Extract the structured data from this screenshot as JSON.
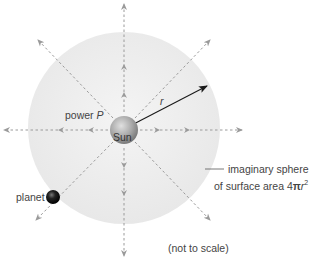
{
  "diagram": {
    "sun_label": "Sun",
    "power_label_prefix": "power ",
    "power_symbol": "P",
    "radius_label": "r",
    "planet_label": "planet",
    "sphere_label_line1": "imaginary sphere",
    "sphere_label_line2_prefix": "of surface area 4",
    "sphere_label_pi": "π",
    "sphere_label_r": "r",
    "sphere_label_exp": "2",
    "scale_note": "(not to scale)"
  },
  "colors": {
    "background": "#ffffff",
    "sphere_fill": "#ececec",
    "ray_color": "#9a9a9a",
    "radius_arrow": "#1a1a1a",
    "sun": "#9a9a9a",
    "planet": "#111111"
  }
}
